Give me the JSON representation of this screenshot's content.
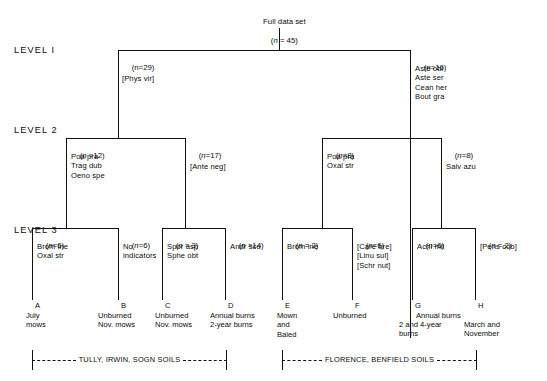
{
  "figure": {
    "type": "dendrogram-classification-tree",
    "root": {
      "title": "Full data set",
      "n_label": "(n = 45)"
    },
    "level_labels": [
      "LEVEL I",
      "LEVEL 2",
      "LEVEL 3"
    ]
  },
  "level1": {
    "left": {
      "n_label": "(n=29)",
      "indicators": "[Phys vir]"
    },
    "right": {
      "n_label": "(n=16)",
      "indicators": "Aste obl\nAste ser\nCean her\nBout gra"
    }
  },
  "level2": {
    "a": {
      "n_label": "(n =12)",
      "indicators": "Poa pra\nTrag dub\nOeno spe"
    },
    "b": {
      "n_label": "(n=17)",
      "indicators": "[Ante neg]"
    },
    "c": {
      "n_label": "(n=8)",
      "indicators": "Poa pra\nOxal str"
    },
    "d": {
      "n_label": "(n=8)",
      "indicators": "Salv azu"
    }
  },
  "level3": [
    {
      "id": "A",
      "n_label": "(n=6)",
      "indicators": "Brom ine\nOxal str",
      "treatment": "July\nmows"
    },
    {
      "id": "B",
      "n_label": "(n=6)",
      "indicators": "No\nindicators",
      "treatment": "Unburned\nNov. mows"
    },
    {
      "id": "C",
      "n_label": "(n = 3)",
      "indicators": "Spor asp\nSphe obt",
      "treatment": "Unburned\nNov. mows"
    },
    {
      "id": "D",
      "n_label": "(n =14)",
      "indicators": "Andr sco",
      "treatment": "Annual burns\n2-year burns"
    },
    {
      "id": "E",
      "n_label": "(n = 2)",
      "indicators": "Brom ine",
      "treatment": "Mown\nand\nBaled"
    },
    {
      "id": "F",
      "n_label": "(n=6)",
      "indicators": "[Care bre]\n[Linu sul]\n[Schr nut]",
      "treatment": "Unburned"
    },
    {
      "id": "G",
      "n_label": "(n=6)",
      "indicators": "Achi mil",
      "treatment_top": "Annual burns",
      "treatment": "2 and 4-year\nburns"
    },
    {
      "id": "H",
      "n_label": "(n = 2)",
      "indicators": "[Pens cob]",
      "treatment": "March and\nNovember"
    }
  ],
  "soil_groups": [
    {
      "label": "TULLY, IRWIN, SOGN SOILS"
    },
    {
      "label": "FLORENCE, BENFIELD SOILS"
    }
  ],
  "colors": {
    "ink": "#111111",
    "background": "#ffffff"
  }
}
